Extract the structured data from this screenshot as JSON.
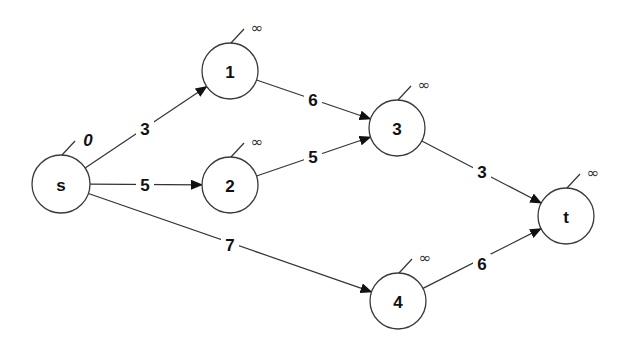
{
  "graph": {
    "title": "",
    "nodes": [
      {
        "id": "s",
        "label": "s",
        "cx": 61,
        "cy": 184,
        "r": 29,
        "distance": "0",
        "is_source": true
      },
      {
        "id": "1",
        "label": "1",
        "cx": 230,
        "cy": 71,
        "r": 28,
        "distance": "∞",
        "is_source": false
      },
      {
        "id": "2",
        "label": "2",
        "cx": 230,
        "cy": 185,
        "r": 28,
        "distance": "∞",
        "is_source": false
      },
      {
        "id": "3",
        "label": "3",
        "cx": 397,
        "cy": 128,
        "r": 28,
        "distance": "∞",
        "is_source": false
      },
      {
        "id": "4",
        "label": "4",
        "cx": 398,
        "cy": 301,
        "r": 28,
        "distance": "∞",
        "is_source": false
      },
      {
        "id": "t",
        "label": "t",
        "cx": 566,
        "cy": 216,
        "r": 28,
        "distance": "∞",
        "is_source": false
      }
    ],
    "edges": [
      {
        "from": "s",
        "to": "1",
        "weight": "3",
        "lx": 145,
        "ly": 129
      },
      {
        "from": "s",
        "to": "2",
        "weight": "5",
        "lx": 145,
        "ly": 185
      },
      {
        "from": "s",
        "to": "4",
        "weight": "7",
        "lx": 230,
        "ly": 245
      },
      {
        "from": "1",
        "to": "3",
        "weight": "6",
        "lx": 313,
        "ly": 100
      },
      {
        "from": "2",
        "to": "3",
        "weight": "5",
        "lx": 313,
        "ly": 157
      },
      {
        "from": "3",
        "to": "t",
        "weight": "3",
        "lx": 482,
        "ly": 172
      },
      {
        "from": "4",
        "to": "t",
        "weight": "6",
        "lx": 482,
        "ly": 264
      }
    ]
  },
  "colors": {
    "stroke": "#333333",
    "text": "#111111",
    "background": "#ffffff"
  }
}
